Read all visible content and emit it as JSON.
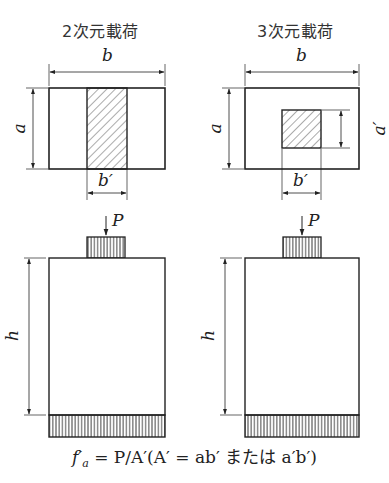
{
  "panels": [
    {
      "id": "2d",
      "title": "2次元載荷",
      "labels": {
        "width": "b",
        "height": "a",
        "load_width": "b′"
      }
    },
    {
      "id": "3d",
      "title": "3次元載荷",
      "labels": {
        "width": "b",
        "height": "a",
        "load_width": "b′",
        "load_height": "a′"
      }
    }
  ],
  "elevation": {
    "load_label": "P",
    "height_label": "h"
  },
  "formula": {
    "text": "f′a = P/A′(A′ = ab′ または a′b′)",
    "lhs": "f′",
    "lhs_sub": "a",
    "rhs": " = P/A′(A′ = ab′ または a′b′)"
  },
  "colors": {
    "line": "#222222",
    "hatch": "#444444",
    "background": "#ffffff"
  }
}
